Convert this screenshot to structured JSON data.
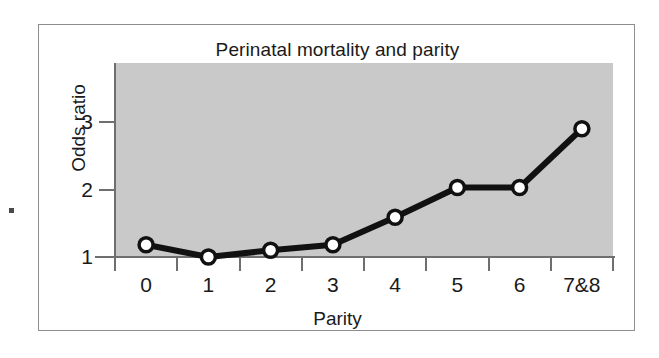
{
  "figure": {
    "title": "Perinatal mortality and parity",
    "plot_background_color": "#c9c9c9",
    "page_background_color": "#ffffff",
    "border_color": "#8d8d8d",
    "series_color": "#111111",
    "marker_fill_color": "#ffffff"
  },
  "chart_data": {
    "type": "line",
    "title": "Perinatal mortality and parity",
    "xlabel": "Parity",
    "ylabel": "Odds ratio",
    "categories": [
      "0",
      "1",
      "2",
      "3",
      "4",
      "5",
      "6",
      "7&8"
    ],
    "values": [
      1.18,
      1.0,
      1.1,
      1.18,
      1.59,
      2.03,
      2.03,
      2.9
    ],
    "ytick_labels": [
      "1",
      "2",
      "3"
    ],
    "ytick_values": [
      1,
      2,
      3
    ],
    "ylim": [
      1.0,
      3.45
    ],
    "grid": false,
    "legend": false,
    "marker": "open-circle",
    "series": [
      {
        "name": "Odds ratio",
        "values": [
          1.18,
          1.0,
          1.1,
          1.18,
          1.59,
          2.03,
          2.03,
          2.9
        ]
      }
    ]
  }
}
